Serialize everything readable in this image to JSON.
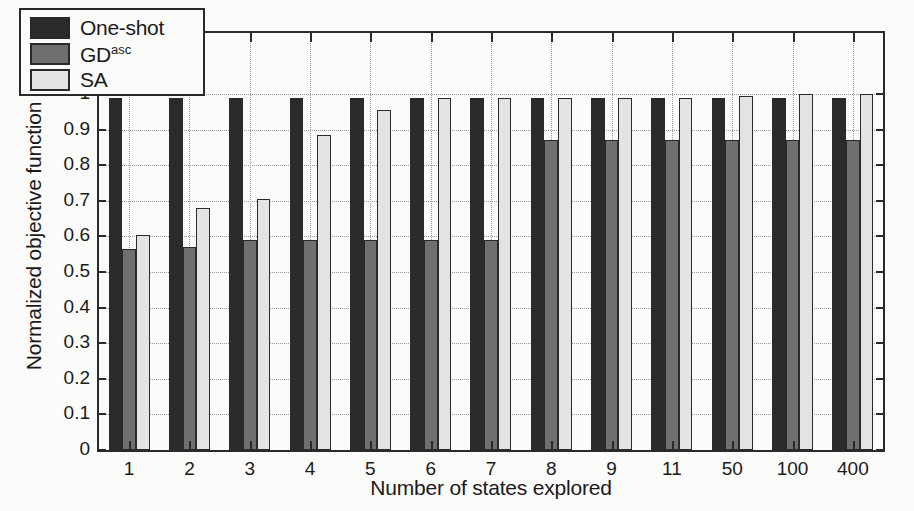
{
  "chart_data": {
    "type": "bar",
    "title": "",
    "xlabel": "Number of states explored",
    "ylabel": "Normalized objective function",
    "categories": [
      "1",
      "2",
      "3",
      "4",
      "5",
      "6",
      "7",
      "8",
      "9",
      "11",
      "50",
      "100",
      "400"
    ],
    "ylim": [
      0,
      1
    ],
    "yticks": [
      "0",
      "0.1",
      "0.2",
      "0.3",
      "0.4",
      "0.5",
      "0.6",
      "0.7",
      "0.8",
      "0.9",
      "1"
    ],
    "ytick_values": [
      0,
      0.1,
      0.2,
      0.3,
      0.4,
      0.5,
      0.6,
      0.7,
      0.8,
      0.9,
      1.0
    ],
    "grid": true,
    "legend_position": "top-left",
    "series": [
      {
        "name": "One-shot",
        "color": "#2b2b2b",
        "values": [
          0.99,
          0.99,
          0.99,
          0.99,
          0.99,
          0.99,
          0.99,
          0.99,
          0.99,
          0.99,
          0.99,
          0.99,
          0.99
        ]
      },
      {
        "name": "GD",
        "name_sup": "asc",
        "color": "#6f6f6f",
        "values": [
          0.565,
          0.57,
          0.59,
          0.59,
          0.59,
          0.59,
          0.59,
          0.87,
          0.87,
          0.87,
          0.87,
          0.87,
          0.87
        ]
      },
      {
        "name": "SA",
        "color": "#e3e3e3",
        "values": [
          0.605,
          0.68,
          0.705,
          0.885,
          0.955,
          0.99,
          0.99,
          0.99,
          0.99,
          0.99,
          0.995,
          1.0,
          1.0
        ]
      }
    ]
  },
  "legend": {
    "items": [
      {
        "label": "One-shot",
        "sup": ""
      },
      {
        "label": "GD",
        "sup": "asc"
      },
      {
        "label": "SA",
        "sup": ""
      }
    ]
  }
}
